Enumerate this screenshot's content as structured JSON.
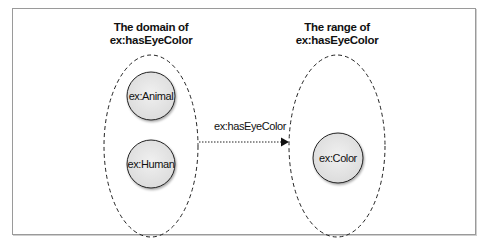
{
  "diagram": {
    "domain_group": {
      "title_line1": "The domain of",
      "title_line2": "ex:hasEyeColor",
      "nodes": [
        {
          "label": "ex:Animal"
        },
        {
          "label": "ex:Human"
        }
      ]
    },
    "range_group": {
      "title_line1": "The range of",
      "title_line2": "ex:hasEyeColor",
      "nodes": [
        {
          "label": "ex:Color"
        }
      ]
    },
    "edge": {
      "label": "ex:hasEyeColor",
      "from": "domain_group",
      "to": "range_group",
      "style": "dotted-arrow"
    },
    "colors": {
      "node_fill": "#e6e6e6",
      "stroke": "#222222",
      "frame": "#9a9a9a"
    }
  }
}
